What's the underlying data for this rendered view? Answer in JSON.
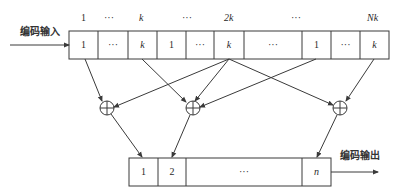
{
  "labels": {
    "input": "编码输入",
    "output": "编码输出"
  },
  "top_index": [
    "1",
    "···",
    "k",
    "···",
    "2k",
    "···",
    "Nk"
  ],
  "top_register": [
    "1",
    "···",
    "k",
    "1",
    "···",
    "k",
    "···",
    "1",
    "···",
    "k"
  ],
  "bottom_register": [
    "1",
    "2",
    "···",
    "n"
  ],
  "xor_symbol": "⊕",
  "colors": {
    "line": "#3a3a3a",
    "background": "#ffffff"
  }
}
